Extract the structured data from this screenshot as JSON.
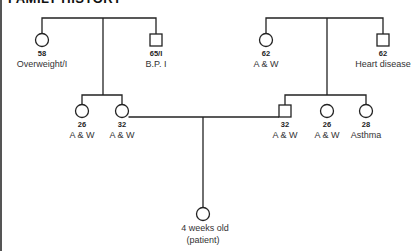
{
  "title": "FAMILY HISTORY",
  "pedigree": {
    "paternal_grandparents": [
      {
        "id": "pgm",
        "sex": "female",
        "age": "58",
        "condition": "Overweight/I"
      },
      {
        "id": "pgf",
        "sex": "male",
        "age": "65/I",
        "condition": "B.P. I"
      }
    ],
    "maternal_grandparents": [
      {
        "id": "mgm",
        "sex": "female",
        "age": "62",
        "condition": "A & W"
      },
      {
        "id": "mgf",
        "sex": "male",
        "age": "62",
        "condition": "Heart disease"
      }
    ],
    "mother_siblings": [
      {
        "id": "aunt1",
        "sex": "female",
        "age": "26",
        "condition": "A & W"
      },
      {
        "id": "mother",
        "sex": "female",
        "age": "32",
        "condition": "A & W"
      }
    ],
    "father_siblings": [
      {
        "id": "father",
        "sex": "male",
        "age": "32",
        "condition": "A & W"
      },
      {
        "id": "aunt2",
        "sex": "female",
        "age": "26",
        "condition": "A & W"
      },
      {
        "id": "aunt3",
        "sex": "female",
        "age": "28",
        "condition": "Asthma"
      }
    ],
    "patient": {
      "sex": "female",
      "line1": "4 weeks old",
      "line2": "(patient)"
    }
  }
}
